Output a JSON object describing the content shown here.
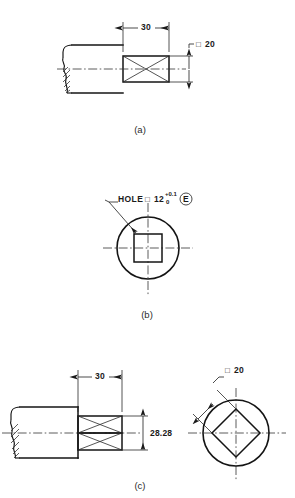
{
  "drawing": {
    "title": "Square section dimensioning — three detail views",
    "type": "engineering-drawing",
    "background": "#ffffff",
    "line_color": "#141414"
  },
  "figures": [
    {
      "id": "a",
      "label": "(a)",
      "caption_x": 140,
      "caption_y": 133,
      "description": "Side view of round shaft with square end, cross-diagonals on the square portion",
      "dimensions": [
        {
          "name": "length",
          "value": "30",
          "x": 148,
          "y": 26,
          "orientation": "horizontal"
        },
        {
          "name": "across-flats",
          "symbol": "square",
          "value": "20",
          "x": 205,
          "y": 48,
          "orientation": "leader"
        }
      ]
    },
    {
      "id": "b",
      "label": "(b)",
      "caption_x": 147,
      "caption_y": 318,
      "description": "End view: circle with square hole at centre, leader note",
      "note": {
        "text": "HOLE",
        "symbol": "square",
        "value": "12",
        "tol_upper": "+0.1",
        "tol_lower": "0",
        "envelope_modifier": "E"
      }
    },
    {
      "id": "c",
      "label": "(c)",
      "caption_x": 140,
      "caption_y": 489,
      "description": "Side view with square end plus end view showing diamond (rotated square) inscribed in circle",
      "dimensions": [
        {
          "name": "length",
          "value": "30",
          "x": 100,
          "y": 377,
          "orientation": "horizontal"
        },
        {
          "name": "across-corners",
          "value": "28.28",
          "x": 150,
          "y": 440,
          "orientation": "vertical"
        },
        {
          "name": "across-flats",
          "symbol": "square",
          "value": "20",
          "x": 224,
          "y": 371,
          "orientation": "leader"
        }
      ]
    }
  ],
  "symbols": {
    "square_glyph": "□",
    "envelope_glyph": "E"
  },
  "text": {
    "label_a": "(a)",
    "label_b": "(b)",
    "label_c": "(c)",
    "dim_30_a": "30",
    "dim_20_a": "20",
    "sq_a": "□",
    "note_hole": "HOLE",
    "sq_b": "□",
    "note_12": "12",
    "tol_up": "+0.1",
    "tol_lo": "0",
    "env_e": "E",
    "dim_30_c": "30",
    "dim_2828_c": "28.28",
    "sq_c": "□",
    "dim_20_c": "20"
  }
}
